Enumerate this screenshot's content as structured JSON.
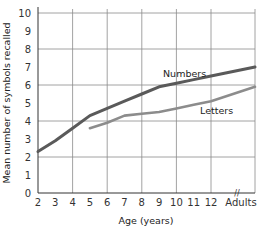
{
  "chart_data": {
    "type": "line",
    "title": "",
    "xlabel": "Age (years)",
    "ylabel": "Mean number of symbols recalled",
    "x_tick_labels": [
      "2",
      "3",
      "4",
      "5",
      "6",
      "7",
      "8",
      "9",
      "10",
      "11",
      "12",
      "Adults"
    ],
    "y_tick_labels": [
      "0",
      "1",
      "2",
      "3",
      "4",
      "5",
      "6",
      "7",
      "8",
      "9",
      "10"
    ],
    "ylim": [
      0,
      10
    ],
    "grid": true,
    "axis_break_label": "//",
    "series": [
      {
        "name": "Numbers",
        "color": "#5a5a5a",
        "x": [
          "2",
          "3",
          "4",
          "5",
          "6",
          "7",
          "8",
          "9",
          "10",
          "11",
          "12",
          "Adults"
        ],
        "values": [
          2.3,
          2.9,
          3.6,
          4.3,
          4.7,
          5.1,
          5.5,
          5.9,
          6.1,
          6.3,
          6.5,
          7.0
        ]
      },
      {
        "name": "Letters",
        "color": "#8c8c8c",
        "x": [
          "5",
          "6",
          "7",
          "8",
          "9",
          "10",
          "11",
          "12",
          "Adults"
        ],
        "values": [
          3.6,
          3.9,
          4.3,
          4.4,
          4.5,
          4.7,
          4.9,
          5.1,
          5.9
        ]
      }
    ]
  }
}
